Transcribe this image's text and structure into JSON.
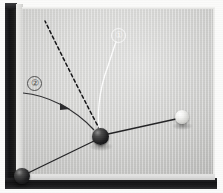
{
  "scene": {
    "title": "Billiard table corner with ball trajectory diagram",
    "width": 223,
    "height": 193,
    "medium": "grayscale photograph with drawn trajectory overlay"
  },
  "colors": {
    "felt": "#d2d2d0",
    "cushion": "#e2e2e0",
    "rail": "#151517",
    "page_margin": "#fbfbfa",
    "dark_ball": "#121214",
    "white_ball": "#f4f4f2",
    "solid_line": "#2a2a2c",
    "dashed_line": "#1a1a1c",
    "white_line": "#ffffff"
  },
  "table": {
    "felt_region": {
      "x": 22,
      "y": 8,
      "width": 193,
      "height": 166
    },
    "cushion_left": {
      "x": 16,
      "y": 4,
      "width": 7,
      "height": 176
    },
    "cushion_bottom": {
      "x": 16,
      "y": 173,
      "width": 199,
      "height": 7
    },
    "rail_left": {
      "x": 5,
      "y": 3,
      "width": 12,
      "height": 182
    },
    "rail_bottom": {
      "x": 5,
      "y": 178,
      "width": 212,
      "height": 11
    }
  },
  "balls": [
    {
      "name": "object-ball-collision",
      "kind": "dark",
      "cx": 100,
      "cy": 136,
      "r": 8.5,
      "role": "collision point / object ball at impact"
    },
    {
      "name": "corner-ball",
      "kind": "dark",
      "cx": 22,
      "cy": 176,
      "r": 8.0,
      "role": "ball resting in bottom-left corner pocket area"
    },
    {
      "name": "cue-ball",
      "kind": "white",
      "cx": 182,
      "cy": 117,
      "r": 7.0,
      "role": "white cue ball at right"
    }
  ],
  "trajectories": [
    {
      "name": "dashed-path",
      "style": "dashed",
      "color": "#1a1a1c",
      "label": null,
      "description": "dashed reference line rising from collision point toward upper left",
      "path": "M 100 130 C 86 104, 64 60, 45 21"
    },
    {
      "name": "white-curve-path",
      "style": "solid",
      "color": "#ffffff",
      "label": "1",
      "description": "white curved trajectory from collision point arcing up to callout 1",
      "path": "M 100 132 C 97 118, 98 92, 108 66 C 112 54, 114 47, 116 42"
    },
    {
      "name": "curved-incoming-path",
      "style": "solid",
      "color": "#2a2a2c",
      "label": "2",
      "description": "dark curved trajectory entering from left cushion and bending into the collision point",
      "path": "M 23 93 C 46 95, 74 108, 94 130"
    },
    {
      "name": "corner-to-collision-path",
      "style": "solid",
      "color": "#2a2a2c",
      "label": null,
      "description": "straight line from bottom-left corner ball to the collision point",
      "path": "M 28 173 L 94 141"
    },
    {
      "name": "collision-to-cue-path",
      "style": "solid",
      "color": "#2a2a2c",
      "label": null,
      "description": "straight line from collision point to the white cue ball at right",
      "path": "M 108 134 L 176 119"
    }
  ],
  "markers": [
    {
      "name": "direction-arrow-on-curve-2",
      "x": 66,
      "y": 107,
      "description": "small arrowhead indicating travel direction along trajectory 2"
    }
  ],
  "callouts": [
    {
      "name": "callout-1",
      "label": "1",
      "display": "①",
      "x": 111,
      "y": 28,
      "color": "#ffffff",
      "attached_to": "white-curve-path"
    },
    {
      "name": "callout-2",
      "label": "2",
      "display": "②",
      "x": 27,
      "y": 76,
      "color": "#3c3c3c",
      "attached_to": "curved-incoming-path"
    }
  ]
}
